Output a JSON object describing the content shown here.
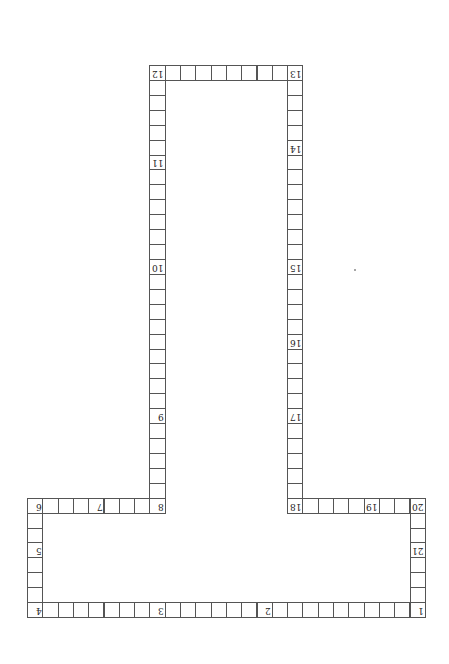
{
  "board": {
    "origin": {
      "x": 27,
      "y": 65
    },
    "cell_width": 15.3,
    "cell_height": 14.92,
    "line_color": "#555555",
    "labels_rotated_180": true,
    "path": [
      {
        "from": [
          25,
          36
        ],
        "to": [
          0,
          36
        ],
        "direction": "left"
      },
      {
        "from": [
          0,
          35
        ],
        "to": [
          0,
          29
        ],
        "direction": "up"
      },
      {
        "from": [
          1,
          29
        ],
        "to": [
          8,
          29
        ],
        "direction": "right"
      },
      {
        "from": [
          8,
          28
        ],
        "to": [
          8,
          0
        ],
        "direction": "up"
      },
      {
        "from": [
          9,
          0
        ],
        "to": [
          17,
          0
        ],
        "direction": "right"
      },
      {
        "from": [
          17,
          1
        ],
        "to": [
          17,
          29
        ],
        "direction": "down"
      },
      {
        "from": [
          18,
          29
        ],
        "to": [
          25,
          29
        ],
        "direction": "right"
      },
      {
        "from": [
          25,
          30
        ],
        "to": [
          25,
          35
        ],
        "direction": "down"
      }
    ],
    "labels": [
      {
        "text": "1",
        "col": 25,
        "row": 36
      },
      {
        "text": "2",
        "col": 15,
        "row": 36
      },
      {
        "text": "3",
        "col": 8,
        "row": 36
      },
      {
        "text": "4",
        "col": 0,
        "row": 36
      },
      {
        "text": "5",
        "col": 0,
        "row": 32
      },
      {
        "text": "6",
        "col": 0,
        "row": 29
      },
      {
        "text": "7",
        "col": 4,
        "row": 29
      },
      {
        "text": "8",
        "col": 8,
        "row": 29
      },
      {
        "text": "9",
        "col": 8,
        "row": 23
      },
      {
        "text": "10",
        "col": 8,
        "row": 13
      },
      {
        "text": "11",
        "col": 8,
        "row": 6
      },
      {
        "text": "12",
        "col": 8,
        "row": 0
      },
      {
        "text": "13",
        "col": 17,
        "row": 0
      },
      {
        "text": "14",
        "col": 17,
        "row": 5
      },
      {
        "text": "15",
        "col": 17,
        "row": 13
      },
      {
        "text": "16",
        "col": 17,
        "row": 18
      },
      {
        "text": "17",
        "col": 17,
        "row": 23
      },
      {
        "text": "18",
        "col": 17,
        "row": 29
      },
      {
        "text": "19",
        "col": 22,
        "row": 29
      },
      {
        "text": "20",
        "col": 25,
        "row": 29
      },
      {
        "text": "21",
        "col": 25,
        "row": 32
      }
    ]
  }
}
